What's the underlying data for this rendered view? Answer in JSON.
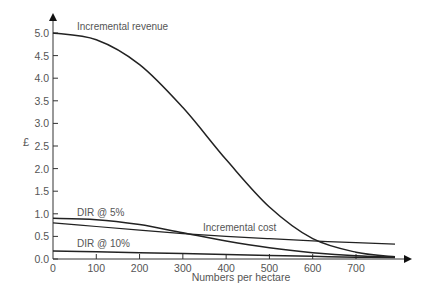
{
  "chart_data": {
    "type": "line",
    "title": "",
    "xlabel": "Numbers per hectare",
    "ylabel": "£",
    "xlim": [
      0,
      800
    ],
    "ylim": [
      0,
      5.0
    ],
    "grid": false,
    "legend": "none (inline curve labels)",
    "x_ticks": [
      "0",
      "100",
      "200",
      "300",
      "400",
      "500",
      "600",
      "700"
    ],
    "y_ticks": [
      "0.0",
      "0.5",
      "1.0",
      "1.5",
      "2.0",
      "2.5",
      "3.0",
      "3.5",
      "4.0",
      "4.5",
      "5.0"
    ],
    "x": [
      0,
      100,
      200,
      300,
      400,
      500,
      600,
      700,
      790
    ],
    "series": [
      {
        "name": "Incremental revenue",
        "values": [
          5.0,
          4.85,
          4.3,
          3.35,
          2.2,
          1.15,
          0.45,
          0.15,
          0.05
        ]
      },
      {
        "name": "Incremental cost",
        "values": [
          0.8,
          0.72,
          0.64,
          0.56,
          0.5,
          0.45,
          0.4,
          0.36,
          0.33
        ]
      },
      {
        "name": "DIR @ 5%",
        "values": [
          0.9,
          0.87,
          0.76,
          0.58,
          0.4,
          0.25,
          0.14,
          0.07,
          0.04
        ]
      },
      {
        "name": "DIR @ 10%",
        "values": [
          0.18,
          0.16,
          0.14,
          0.12,
          0.1,
          0.08,
          0.06,
          0.04,
          0.03
        ]
      }
    ],
    "annotations": [
      {
        "text": "Incremental revenue",
        "x": 80,
        "y": 5.0
      },
      {
        "text": "DIR @ 5%",
        "x": 100,
        "y": 0.98
      },
      {
        "text": "Incremental cost",
        "x": 430,
        "y": 0.62
      },
      {
        "text": "DIR @ 10%",
        "x": 100,
        "y": 0.27
      }
    ]
  },
  "labels": {
    "ylabel": "£",
    "xlabel": "Numbers per hectare",
    "revenue": "Incremental revenue",
    "cost": "Incremental cost",
    "dir5": "DIR @ 5%",
    "dir10": "DIR @ 10%"
  }
}
